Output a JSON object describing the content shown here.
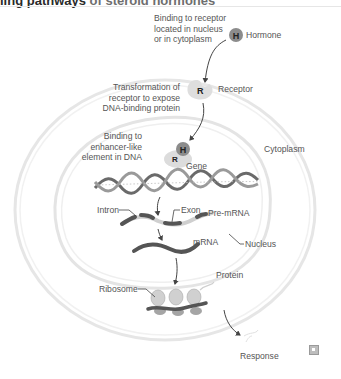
{
  "title": {
    "bold": "ling pathways",
    "light": " of steroid hormones"
  },
  "labels": {
    "binding_receptor": [
      "Binding to receptor",
      "located in nucleus",
      "or in cytoplasm"
    ],
    "hormone": "Hormone",
    "hormone_symbol": "H",
    "receptor_symbol": "R",
    "receptor": "Receptor",
    "transformation": [
      "Transformation of",
      "receptor to expose",
      "DNA-binding protein"
    ],
    "binding_enhancer": [
      "Binding to",
      "enhancer-like",
      "element in DNA"
    ],
    "gene": "Gene",
    "cytoplasm": "Cytoplasm",
    "intron": "Intron",
    "exon": "Exon",
    "pre_mrna": "Pre-mRNA",
    "mrna": "mRNA",
    "nucleus": "Nucleus",
    "protein": "Protein",
    "ribosome": "Ribosome",
    "response": "Response"
  },
  "icons": {
    "expand": "expand-icon"
  },
  "colors": {
    "membrane": "#e3e3e3",
    "hormone": "#8c8c8c",
    "receptor": "#dedede",
    "strand_dark": "#555555",
    "strand_light": "#c8c8c8",
    "text": "#555555"
  }
}
